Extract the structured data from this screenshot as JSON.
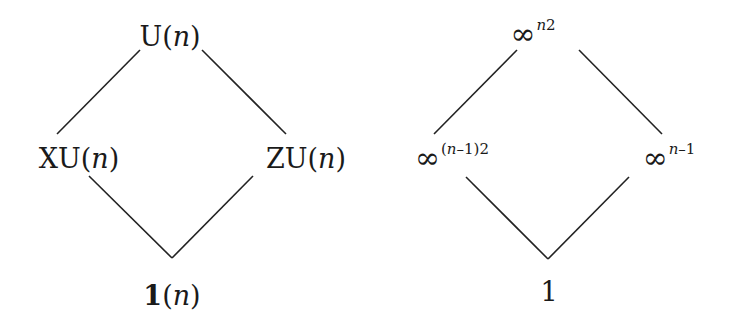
{
  "left_lattice": {
    "top": {
      "prefix": "U(",
      "var": "n",
      "suffix": ")"
    },
    "middle_left": {
      "prefix": "XU(",
      "var": "n",
      "suffix": ")"
    },
    "middle_right": {
      "prefix": "ZU(",
      "var": "n",
      "suffix": ")"
    },
    "bottom": {
      "bold": "1",
      "prefix": "(",
      "var": "n",
      "suffix": ")"
    }
  },
  "right_lattice": {
    "top": {
      "base": "∞",
      "exp_var": "n",
      "exp_rest": "2"
    },
    "middle_left": {
      "base": "∞",
      "exp_pre": "(",
      "exp_var": "n",
      "exp_rest": "–1)2"
    },
    "middle_right": {
      "base": "∞",
      "exp_var": "n",
      "exp_rest": "–1"
    },
    "bottom": {
      "text": "1"
    }
  },
  "style": {
    "line_color": "#222222",
    "text_color": "#1a1a1a",
    "background": "#ffffff"
  }
}
